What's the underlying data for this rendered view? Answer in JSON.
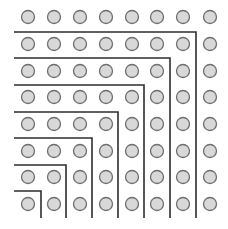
{
  "diagram": {
    "grid": {
      "rows": 8,
      "cols": 8,
      "col_x": [
        28,
        54,
        80,
        106,
        132,
        157,
        183,
        210
      ],
      "row_y": [
        17,
        44,
        71,
        97,
        124,
        151,
        177,
        204
      ],
      "radius": 6.5
    },
    "l_shapes": [
      {
        "y": 32,
        "x": 196
      },
      {
        "y": 58,
        "x": 170
      },
      {
        "y": 85,
        "x": 144
      },
      {
        "y": 112,
        "x": 118
      },
      {
        "y": 138,
        "x": 92
      },
      {
        "y": 165,
        "x": 66
      },
      {
        "y": 191,
        "x": 41
      }
    ],
    "line_start_x": 14,
    "line_end_y": 218,
    "colors": {
      "background": "#ffffff",
      "circle_fill": "#d8d8d8",
      "circle_stroke": "#6e6e6e",
      "line": "#2e2e2e"
    }
  }
}
